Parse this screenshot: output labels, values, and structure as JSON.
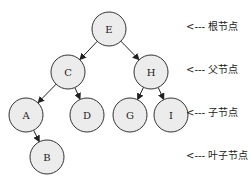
{
  "diagram": {
    "type": "binary-tree",
    "nodes": [
      {
        "id": "E",
        "label": "E",
        "x": 109,
        "y": 29
      },
      {
        "id": "C",
        "label": "C",
        "x": 68,
        "y": 72
      },
      {
        "id": "H",
        "label": "H",
        "x": 151,
        "y": 72
      },
      {
        "id": "A",
        "label": "A",
        "x": 26,
        "y": 115
      },
      {
        "id": "D",
        "label": "D",
        "x": 87,
        "y": 115
      },
      {
        "id": "G",
        "label": "G",
        "x": 130,
        "y": 115
      },
      {
        "id": "I",
        "label": "I",
        "x": 171,
        "y": 115
      },
      {
        "id": "B",
        "label": "B",
        "x": 47,
        "y": 157
      }
    ],
    "edges": [
      {
        "from": "E",
        "to": "C"
      },
      {
        "from": "E",
        "to": "H"
      },
      {
        "from": "C",
        "to": "A"
      },
      {
        "from": "C",
        "to": "D"
      },
      {
        "from": "H",
        "to": "G"
      },
      {
        "from": "H",
        "to": "I"
      },
      {
        "from": "A",
        "to": "B"
      }
    ],
    "annotations": [
      {
        "text": "<--- 根节点",
        "y": 24
      },
      {
        "text": "<--- 父节点",
        "y": 67
      },
      {
        "text": "<--- 子节点",
        "y": 110
      },
      {
        "text": "<--- 叶子节点",
        "y": 153
      }
    ],
    "colors": {
      "node_fill": "#ececec",
      "node_stroke": "#333333",
      "edge": "#222222"
    }
  }
}
